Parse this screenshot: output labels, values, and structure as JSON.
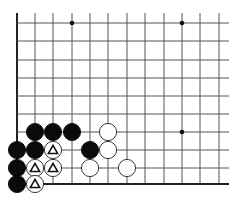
{
  "diagram": {
    "type": "go-board-fragment",
    "background": "#ffffff",
    "line_color": "#555555",
    "edge_color": "#222222",
    "columns_x": [
      17,
      35,
      53,
      72,
      90,
      108,
      127,
      145,
      164,
      182,
      200,
      219
    ],
    "rows_y": [
      23,
      41,
      60,
      78,
      96,
      114,
      132,
      150,
      168,
      184
    ],
    "line_extent": {
      "top": 13,
      "right": 229
    },
    "edges": [
      "left",
      "bottom"
    ],
    "star_points": [
      {
        "col": 3,
        "row": 0
      },
      {
        "col": 9,
        "row": 0
      },
      {
        "col": 9,
        "row": 6
      }
    ],
    "stone_radius": 8.6,
    "stones": [
      {
        "color": "black",
        "col": 1,
        "row": 6
      },
      {
        "color": "black",
        "col": 2,
        "row": 6
      },
      {
        "color": "black",
        "col": 3,
        "row": 6
      },
      {
        "color": "white",
        "col": 5,
        "row": 6
      },
      {
        "color": "black",
        "col": 0,
        "row": 7
      },
      {
        "color": "black",
        "col": 1,
        "row": 7
      },
      {
        "color": "white",
        "col": 2,
        "row": 7,
        "mark": "triangle"
      },
      {
        "color": "black",
        "col": 4,
        "row": 7
      },
      {
        "color": "white",
        "col": 5,
        "row": 7
      },
      {
        "color": "black",
        "col": 0,
        "row": 8
      },
      {
        "color": "white",
        "col": 1,
        "row": 8,
        "mark": "triangle"
      },
      {
        "color": "white",
        "col": 2,
        "row": 8,
        "mark": "triangle"
      },
      {
        "color": "white",
        "col": 4,
        "row": 8
      },
      {
        "color": "white",
        "col": 6,
        "row": 8
      },
      {
        "color": "black",
        "col": 0,
        "row": 9
      },
      {
        "color": "white",
        "col": 1,
        "row": 9,
        "mark": "triangle"
      }
    ]
  }
}
